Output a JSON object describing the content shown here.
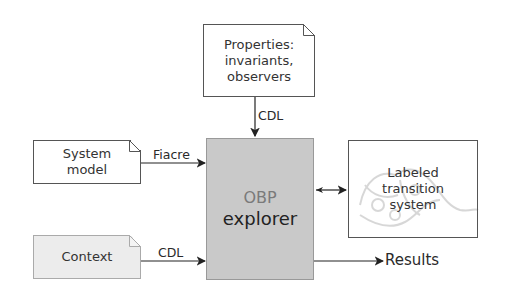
{
  "properties_box": {
    "lines": [
      "Properties:",
      "invariants,",
      "observers"
    ]
  },
  "system_model_box": {
    "lines": [
      "System",
      "model"
    ]
  },
  "context_box": {
    "label": "Context"
  },
  "explorer_box": {
    "title": "OBP",
    "subtitle": "explorer",
    "fill": "#c9c9c9"
  },
  "lts_box": {
    "lines": [
      "Labeled",
      "transition",
      "system"
    ]
  },
  "edges": {
    "properties_to_explorer": "CDL",
    "system_model_to_explorer": "Fiacre",
    "context_to_explorer": "CDL",
    "explorer_lts": "",
    "explorer_to_results": "Results"
  }
}
